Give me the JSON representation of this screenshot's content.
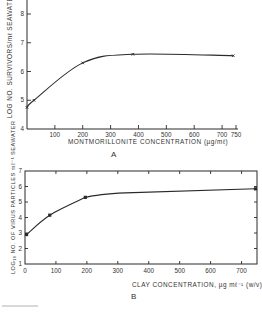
{
  "chart_data": [
    {
      "panel": "A",
      "type": "line",
      "title": "",
      "xlabel": "MONTMORILLONITE CONCENTRATION (µg/mℓ)",
      "ylabel": "LOG  NO. SURVIVORS/mℓ SEAWATER",
      "xlim": [
        0,
        750
      ],
      "ylim": [
        4,
        8
      ],
      "x_ticks": [
        100,
        200,
        300,
        400,
        500,
        600,
        700,
        750
      ],
      "y_ticks": [
        4,
        5,
        6,
        7,
        8
      ],
      "grid": false,
      "marker": "x",
      "x": [
        0,
        25,
        200,
        380,
        740
      ],
      "values": [
        4.75,
        5.0,
        6.3,
        6.6,
        6.55
      ]
    },
    {
      "panel": "B",
      "type": "line",
      "title": "",
      "xlabel": "CLAY CONCENTRATION,  µg mℓ⁻¹ (w/v)",
      "ylabel": "LOG₁₀ NO. OF VIRUS PARTICLES mℓ⁻¹ SEAWATER",
      "xlim": [
        0,
        750
      ],
      "ylim": [
        1,
        7
      ],
      "x_ticks": [
        0,
        100,
        200,
        300,
        400,
        500,
        600,
        700
      ],
      "y_ticks": [
        1,
        2,
        3,
        4,
        5,
        6,
        7
      ],
      "grid": false,
      "marker": "square",
      "x": [
        5,
        80,
        195,
        745
      ],
      "values": [
        2.9,
        4.15,
        5.3,
        5.85
      ]
    }
  ],
  "labels": {
    "panel_a": "A",
    "panel_b": "B",
    "a_xlabel": "MONTMORILLONITE CONCENTRATION (µg/mℓ)",
    "a_ylabel": "LOG  NO. SURVIVORS/mℓ SEAWATER",
    "b_xlabel": "CLAY CONCENTRATION,  µg mℓ⁻¹  (w/v)",
    "b_ylabel": "LOG₁₀ NO. OF VIRUS PARTICLES mℓ⁻¹ SEAWATER"
  },
  "colors": {
    "ink": "#2a2a2a",
    "background": "#ffffff"
  }
}
